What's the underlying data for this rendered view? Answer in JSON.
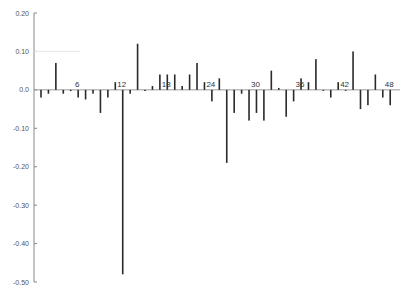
{
  "chart_data": {
    "type": "bar",
    "title": "",
    "xlabel": "",
    "ylabel": "",
    "ylim": [
      -0.5,
      0.2
    ],
    "yticks": [
      0.2,
      0.1,
      0.0,
      -0.1,
      -0.2,
      -0.3,
      -0.4,
      -0.5
    ],
    "ytick_labels": [
      "0.20",
      "0.10",
      "0.0",
      "-0.10",
      "-0.20",
      "-0.30",
      "-0.40",
      "-0.50"
    ],
    "x_axis_labels": [
      {
        "lag": 6,
        "label": "6"
      },
      {
        "lag": 12,
        "label": "12"
      },
      {
        "lag": 18,
        "label": "18"
      },
      {
        "lag": 24,
        "label": "24"
      },
      {
        "lag": 30,
        "label": "30"
      },
      {
        "lag": 36,
        "label": "36"
      },
      {
        "lag": 42,
        "label": "42"
      },
      {
        "lag": 48,
        "label": "48"
      }
    ],
    "grid": false,
    "legend": null,
    "x": [
      1,
      2,
      3,
      4,
      5,
      6,
      7,
      8,
      9,
      10,
      11,
      12,
      13,
      14,
      15,
      16,
      17,
      18,
      19,
      20,
      21,
      22,
      23,
      24,
      25,
      26,
      27,
      28,
      29,
      30,
      31,
      32,
      33,
      34,
      35,
      36,
      37,
      38,
      39,
      40,
      41,
      42,
      43,
      44,
      45,
      46,
      47,
      48
    ],
    "values": [
      -0.02,
      -0.01,
      0.07,
      -0.01,
      -0.003,
      -0.02,
      -0.025,
      -0.01,
      -0.06,
      -0.02,
      0.02,
      -0.48,
      -0.01,
      0.12,
      -0.003,
      0.01,
      0.04,
      0.04,
      0.04,
      0.01,
      0.04,
      0.07,
      0.02,
      -0.03,
      0.03,
      -0.19,
      -0.06,
      -0.01,
      -0.08,
      -0.06,
      -0.08,
      0.05,
      0.005,
      -0.07,
      -0.03,
      0.03,
      0.02,
      0.08,
      0.0,
      -0.02,
      0.02,
      0.0,
      0.1,
      -0.05,
      -0.04,
      0.04,
      -0.02,
      -0.04
    ]
  },
  "colors": {
    "bar": "#2a2a2a",
    "axis": "#888888",
    "zero_line": "#999999",
    "label": "#555555"
  }
}
